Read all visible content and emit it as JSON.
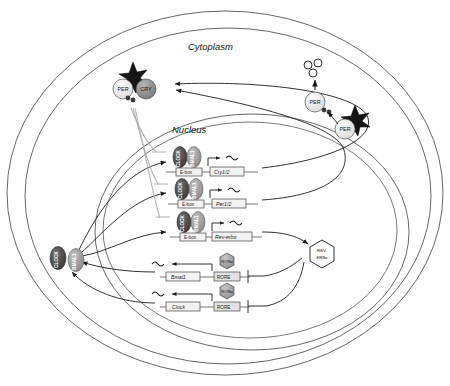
{
  "diagram": {
    "compartments": {
      "cytoplasm": "Cytoplasm",
      "nucleus": "Nucleus"
    },
    "colors": {
      "clock_fill": "#4a4a4a",
      "bmal1_fill": "#9a9a9a",
      "per_fill": "#efefef",
      "cry_fill": "#8a8a8a",
      "rora_fill": "#a0a0a0",
      "reverb_fill": "#ffffff",
      "ckie_fill": "#1a1a1a",
      "arrow_stroke": "#1a1a1a",
      "inhibit_gray": "#b0b0b0",
      "membrane_stroke": "#555555",
      "gene_box_fill": "#f2f2f2"
    },
    "cytoplasm_proteins": {
      "per_cry_complex": {
        "per": "PER",
        "cry": "CRY",
        "kinase": "CKIe"
      },
      "per_kinase_complex": {
        "per": "PER",
        "kinase": "CKIe"
      },
      "per_phospho": {
        "per": "PER"
      },
      "degradation_label": ""
    },
    "nucleus_proteins": {
      "clock": "CLOCK",
      "bmal1": "BMAL1"
    },
    "ebox_genes": [
      {
        "id": "cry12",
        "activator_left": "CLOCK",
        "activator_right": "BMAL1",
        "promoter_element": "E-box",
        "gene_name": "Cry1/2"
      },
      {
        "id": "per12",
        "activator_left": "CLOCK",
        "activator_right": "BMAL1",
        "promoter_element": "E-box",
        "gene_name": "Per1/2"
      },
      {
        "id": "reverba",
        "activator_left": "CLOCK",
        "activator_right": "BMAL1",
        "promoter_element": "E-box",
        "gene_name": "Rev-erbα"
      }
    ],
    "rore_genes": [
      {
        "id": "bmal1",
        "regulator": "RORα",
        "promoter_element": "RORE",
        "gene_name": "Bmal1"
      },
      {
        "id": "clock",
        "regulator": "RORα",
        "promoter_element": "RORE",
        "gene_name": "Clock"
      }
    ],
    "nuclear_receptor": {
      "line1": "REV-",
      "line2": "ERBα"
    }
  }
}
